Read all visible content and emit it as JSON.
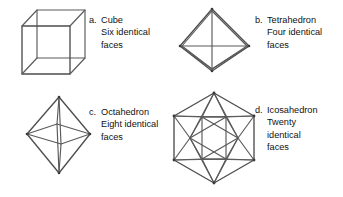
{
  "page": {
    "background_color": "#ffffff",
    "line_color": "#5a5a5a",
    "text_color": "#111111"
  },
  "figures": [
    {
      "id": "cube",
      "letter": "a.",
      "name": "Cube",
      "desc_line1": "Six identical",
      "desc_line2": "faces",
      "desc_line3": "",
      "face_count_word": "Six"
    },
    {
      "id": "tetrahedron",
      "letter": "b.",
      "name": "Tetrahedron",
      "desc_line1": "Four identical",
      "desc_line2": "faces",
      "desc_line3": "",
      "face_count_word": "Four"
    },
    {
      "id": "octahedron",
      "letter": "c.",
      "name": "Octahedron",
      "desc_line1": "Eight identical",
      "desc_line2": "faces",
      "desc_line3": "",
      "face_count_word": "Eight"
    },
    {
      "id": "icosahedron",
      "letter": "d.",
      "name": "Icosahedron",
      "desc_line1": "Twenty",
      "desc_line2": "identical",
      "desc_line3": "faces",
      "face_count_word": "Twenty"
    }
  ]
}
